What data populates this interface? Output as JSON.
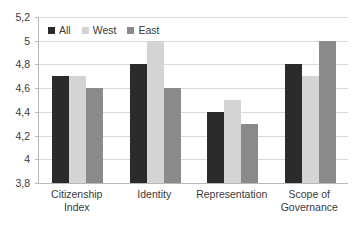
{
  "chart_data": {
    "type": "bar",
    "title": "",
    "xlabel": "",
    "ylabel": "",
    "categories": [
      "Citizenship Index",
      "Identity",
      "Representation",
      "Scope of Governance"
    ],
    "category_lines": [
      [
        "Citizenship",
        "Index"
      ],
      [
        "Identity"
      ],
      [
        "Representation"
      ],
      [
        "Scope of",
        "Governance"
      ]
    ],
    "series": [
      {
        "name": "All",
        "color": "#2b2b2b",
        "values": [
          4.7,
          4.8,
          4.4,
          4.8
        ]
      },
      {
        "name": "West",
        "color": "#d4d4d4",
        "values": [
          4.7,
          5.0,
          4.5,
          4.7
        ]
      },
      {
        "name": "East",
        "color": "#8a8a8a",
        "values": [
          4.6,
          4.6,
          4.3,
          5.0
        ]
      }
    ],
    "ylim": [
      3.8,
      5.2
    ],
    "ytick_step": 0.2,
    "ytick_labels": [
      "5,2",
      "5",
      "4,8",
      "4,6",
      "4,4",
      "4,2",
      "4",
      "3,8"
    ],
    "ytick_values": [
      5.2,
      5.0,
      4.8,
      4.6,
      4.4,
      4.2,
      4.0,
      3.8
    ],
    "grid": true,
    "legend_position": "top-left",
    "decimal_separator": ","
  },
  "legend": {
    "items": [
      {
        "label": "All",
        "color": "#2b2b2b"
      },
      {
        "label": "West",
        "color": "#d4d4d4"
      },
      {
        "label": "East",
        "color": "#8a8a8a"
      }
    ]
  },
  "colors": {
    "background": "#ffffff",
    "gridline": "#d8d8d8",
    "axis": "#b9b9b9",
    "text": "#3a3a3a"
  }
}
